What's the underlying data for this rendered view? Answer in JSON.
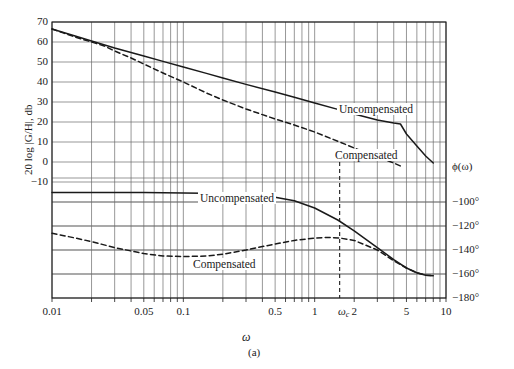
{
  "figure": {
    "caption": "(a)",
    "x_axis_title": "ω",
    "y_axis_title": "20 log |G/H|, db",
    "phase_axis_title": "ϕ(ω)"
  },
  "axes": {
    "x_ticks": [
      {
        "value": 0.01,
        "label": "0.01"
      },
      {
        "value": 0.05,
        "label": "0.05"
      },
      {
        "value": 0.1,
        "label": "0.1"
      },
      {
        "value": 0.5,
        "label": "0.5"
      },
      {
        "value": 1,
        "label": "1"
      },
      {
        "value": 1.55,
        "label": "ω'c"
      },
      {
        "value": 2,
        "label": "2"
      },
      {
        "value": 5,
        "label": "5"
      },
      {
        "value": 10,
        "label": "10"
      }
    ],
    "x_range": [
      0.01,
      10
    ],
    "y_ticks_magnitude": [
      "70",
      "60",
      "50",
      "40",
      "30",
      "20",
      "10",
      "0",
      "-10"
    ],
    "y_range_magnitude": [
      -10,
      70
    ],
    "y_ticks_phase": [
      "ϕ(ω)",
      "-100°",
      "-120°",
      "-140°",
      "-160°",
      "-180°"
    ],
    "y_range_phase": [
      -180,
      -80
    ]
  },
  "annotations": {
    "mag_uncompensated": "Uncompensated",
    "mag_compensated": "Compensated",
    "phase_uncompensated": "Uncompensated",
    "phase_compensated": "Compensated",
    "crossover_marker": "ω'c"
  },
  "colors": {
    "curve": "#1a1a1a",
    "grid": "#6b6b6b",
    "frame": "#1a1a1a",
    "background": "#ffffff"
  },
  "chart_data": {
    "type": "line",
    "title": "",
    "xlabel": "ω",
    "ylabel": "20 log |G/H|, db",
    "y2label": "ϕ(ω)",
    "xscale": "log",
    "xlim": [
      0.01,
      10
    ],
    "ylim": [
      -10,
      70
    ],
    "y2lim": [
      -180,
      -80
    ],
    "grid": true,
    "legend": "inline-annotations",
    "series": [
      {
        "name": "Uncompensated magnitude",
        "axis": "left",
        "style": "solid",
        "units": "db",
        "points": [
          [
            0.01,
            66.5
          ],
          [
            0.015,
            63.0
          ],
          [
            0.02,
            60.5
          ],
          [
            0.03,
            57.0
          ],
          [
            0.05,
            53.0
          ],
          [
            0.07,
            50.3
          ],
          [
            0.1,
            47.5
          ],
          [
            0.15,
            44.3
          ],
          [
            0.2,
            42.0
          ],
          [
            0.3,
            38.8
          ],
          [
            0.5,
            35.0
          ],
          [
            0.7,
            32.4
          ],
          [
            1.0,
            29.5
          ],
          [
            1.5,
            26.3
          ],
          [
            2.0,
            24.0
          ],
          [
            3.0,
            21.0
          ],
          [
            4.0,
            19.5
          ],
          [
            4.5,
            19.0
          ],
          [
            5.0,
            14.0
          ],
          [
            6.0,
            8.0
          ],
          [
            7.0,
            3.0
          ],
          [
            8.0,
            -0.5
          ]
        ]
      },
      {
        "name": "Compensated magnitude",
        "axis": "left",
        "style": "dashed",
        "units": "db",
        "points": [
          [
            0.01,
            66.5
          ],
          [
            0.015,
            62.5
          ],
          [
            0.02,
            60.0
          ],
          [
            0.025,
            58.0
          ],
          [
            0.03,
            55.5
          ],
          [
            0.04,
            52.0
          ],
          [
            0.05,
            49.0
          ],
          [
            0.07,
            44.5
          ],
          [
            0.1,
            40.0
          ],
          [
            0.15,
            34.5
          ],
          [
            0.2,
            31.0
          ],
          [
            0.3,
            26.5
          ],
          [
            0.5,
            21.5
          ],
          [
            0.7,
            18.5
          ],
          [
            1.0,
            15.0
          ],
          [
            1.55,
            10.0
          ],
          [
            2.0,
            7.0
          ],
          [
            3.0,
            2.5
          ],
          [
            4.0,
            -0.5
          ],
          [
            4.5,
            -2.0
          ]
        ]
      },
      {
        "name": "Uncompensated phase",
        "axis": "right",
        "style": "solid",
        "units": "degrees",
        "points": [
          [
            0.01,
            -92
          ],
          [
            0.02,
            -92
          ],
          [
            0.05,
            -92
          ],
          [
            0.1,
            -92.5
          ],
          [
            0.2,
            -93
          ],
          [
            0.3,
            -94
          ],
          [
            0.5,
            -96
          ],
          [
            0.7,
            -99
          ],
          [
            1.0,
            -105
          ],
          [
            1.5,
            -115
          ],
          [
            2.0,
            -124
          ],
          [
            3.0,
            -138
          ],
          [
            4.0,
            -148
          ],
          [
            5.0,
            -155
          ],
          [
            6.0,
            -159
          ],
          [
            7.0,
            -161
          ],
          [
            8.0,
            -161.5
          ]
        ]
      },
      {
        "name": "Compensated phase",
        "axis": "right",
        "style": "dashed",
        "units": "degrees",
        "points": [
          [
            0.01,
            -126
          ],
          [
            0.015,
            -130
          ],
          [
            0.02,
            -133
          ],
          [
            0.03,
            -138
          ],
          [
            0.05,
            -143
          ],
          [
            0.07,
            -145
          ],
          [
            0.1,
            -145.5
          ],
          [
            0.15,
            -145
          ],
          [
            0.2,
            -143.5
          ],
          [
            0.3,
            -140
          ],
          [
            0.5,
            -135
          ],
          [
            0.7,
            -132
          ],
          [
            1.0,
            -130
          ],
          [
            1.3,
            -129.5
          ],
          [
            1.55,
            -130
          ],
          [
            2.0,
            -132
          ],
          [
            3.0,
            -140
          ],
          [
            4.0,
            -149
          ],
          [
            5.0,
            -155
          ],
          [
            6.0,
            -159
          ],
          [
            7.0,
            -161
          ],
          [
            8.0,
            -161.5
          ]
        ]
      }
    ],
    "markers": [
      {
        "name": "crossover",
        "label": "ω'c",
        "x": 1.55,
        "style": "vertical-dashed",
        "y_from": 0,
        "y_to": -180
      }
    ]
  }
}
